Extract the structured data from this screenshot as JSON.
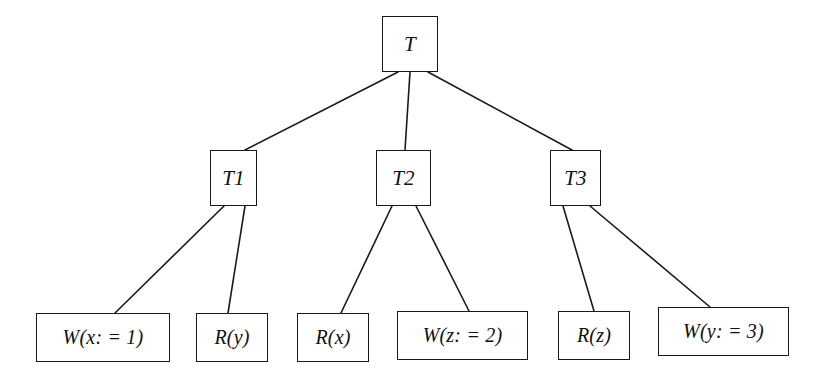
{
  "diagram": {
    "type": "transaction-tree",
    "title": "",
    "background_color": "#ffffff",
    "line_color": "#1a1a1a",
    "text_color": "#101010",
    "nodes": [
      {
        "id": "T",
        "label": "T",
        "kind": "transaction",
        "level": 0,
        "x": 382,
        "y": 16,
        "w": 56,
        "h": 56
      },
      {
        "id": "T1",
        "label": "T1",
        "kind": "transaction",
        "level": 1,
        "x": 210,
        "y": 150,
        "w": 47,
        "h": 56
      },
      {
        "id": "T2",
        "label": "T2",
        "kind": "transaction",
        "level": 1,
        "x": 376,
        "y": 150,
        "w": 55,
        "h": 56
      },
      {
        "id": "T3",
        "label": "T3",
        "kind": "transaction",
        "level": 1,
        "x": 550,
        "y": 150,
        "w": 51,
        "h": 56
      },
      {
        "id": "L1",
        "label": "W(x: = 1)",
        "kind": "operation",
        "level": 2,
        "x": 36,
        "y": 313,
        "w": 134,
        "h": 49
      },
      {
        "id": "L2",
        "label": "R(y)",
        "kind": "operation",
        "level": 2,
        "x": 196,
        "y": 313,
        "w": 72,
        "h": 49
      },
      {
        "id": "L3",
        "label": "R(x)",
        "kind": "operation",
        "level": 2,
        "x": 297,
        "y": 313,
        "w": 72,
        "h": 49
      },
      {
        "id": "L4",
        "label": "W(z: = 2)",
        "kind": "operation",
        "level": 2,
        "x": 397,
        "y": 311,
        "w": 131,
        "h": 49
      },
      {
        "id": "L5",
        "label": "R(z)",
        "kind": "operation",
        "level": 2,
        "x": 558,
        "y": 311,
        "w": 72,
        "h": 49
      },
      {
        "id": "L6",
        "label": "W(y: = 3)",
        "kind": "operation",
        "level": 2,
        "x": 658,
        "y": 307,
        "w": 131,
        "h": 49
      }
    ],
    "edges": [
      {
        "from": "T",
        "to": "T1",
        "x1": 398,
        "y1": 72,
        "x2": 245,
        "y2": 150
      },
      {
        "from": "T",
        "to": "T2",
        "x1": 410,
        "y1": 72,
        "x2": 405,
        "y2": 150
      },
      {
        "from": "T",
        "to": "T3",
        "x1": 428,
        "y1": 72,
        "x2": 572,
        "y2": 150
      },
      {
        "from": "T1",
        "to": "L1",
        "x1": 224,
        "y1": 206,
        "x2": 115,
        "y2": 313
      },
      {
        "from": "T1",
        "to": "L2",
        "x1": 245,
        "y1": 206,
        "x2": 228,
        "y2": 313
      },
      {
        "from": "T2",
        "to": "L3",
        "x1": 392,
        "y1": 206,
        "x2": 341,
        "y2": 313
      },
      {
        "from": "T2",
        "to": "L4",
        "x1": 416,
        "y1": 206,
        "x2": 469,
        "y2": 311
      },
      {
        "from": "T3",
        "to": "L5",
        "x1": 563,
        "y1": 206,
        "x2": 594,
        "y2": 311
      },
      {
        "from": "T3",
        "to": "L6",
        "x1": 590,
        "y1": 206,
        "x2": 710,
        "y2": 307
      }
    ]
  }
}
